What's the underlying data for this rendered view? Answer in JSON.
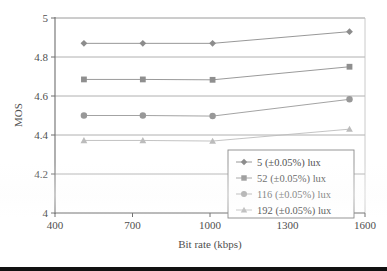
{
  "chart_data": {
    "type": "line",
    "title": "",
    "xlabel": "Bit rate (kbps)",
    "ylabel": "MOS",
    "xlim": [
      400,
      1600
    ],
    "ylim": [
      4,
      5
    ],
    "xticks": [
      400,
      700,
      1000,
      1300,
      1600
    ],
    "xtick_labels": [
      "400",
      "700",
      "1000",
      "1300",
      "1600"
    ],
    "yticks": [
      4,
      4.2,
      4.4,
      4.6,
      4.8,
      5
    ],
    "ytick_labels": [
      "4",
      "4.2",
      "4.4",
      "4.6",
      "4.8",
      "5"
    ],
    "grid": "horizontal",
    "legend_position": "lower right",
    "x": [
      512,
      740,
      1010,
      1540
    ],
    "series": [
      {
        "name": "5 (±0.05%) lux",
        "marker": "diamond",
        "color": "#8c8c8c",
        "values": [
          4.87,
          4.87,
          4.87,
          4.93
        ]
      },
      {
        "name": "52 (±0.05%) lux",
        "marker": "square",
        "color": "#8f8f8f",
        "values": [
          4.685,
          4.685,
          4.683,
          4.75
        ]
      },
      {
        "name": "116 (±0.05%) lux",
        "marker": "circle",
        "color": "#989898",
        "values": [
          4.5,
          4.5,
          4.497,
          4.583
        ]
      },
      {
        "name": "192 (±0.05%) lux",
        "marker": "triangle",
        "color": "#bcbcbc",
        "values": [
          4.372,
          4.372,
          4.369,
          4.43
        ]
      }
    ]
  },
  "legend": {
    "entries": [
      "5 (±0.05%) lux",
      "52 (±0.05%) lux",
      "116 (±0.05%) lux",
      "192 (±0.05%) lux"
    ]
  },
  "colors": {
    "series_1": "#8c8c8c",
    "series_2": "#8f8f8f",
    "series_3": "#989898",
    "series_4": "#bcbcbc",
    "grid": "#9c9c9c",
    "axis": "#6e6e6e",
    "text": "#4f4f4f",
    "page_background": "#ffffff",
    "footer_bar": "#111111"
  }
}
